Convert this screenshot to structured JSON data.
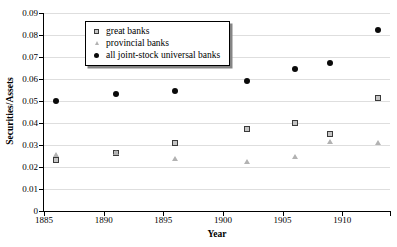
{
  "chart_data": {
    "type": "scatter",
    "title": "",
    "xlabel": "Year",
    "ylabel": "Securities/Assets",
    "xlim": [
      1885,
      1914
    ],
    "ylim": [
      0,
      0.09
    ],
    "grid": "horizontal",
    "legend_position": "top-left",
    "x_ticks": [
      1885,
      1890,
      1895,
      1900,
      1905,
      1910
    ],
    "x_tick_labels": [
      "1885",
      "1890",
      "1895",
      "1900",
      "1905",
      "1910"
    ],
    "y_ticks": [
      0,
      0.01,
      0.02,
      0.03,
      0.04,
      0.05,
      0.06,
      0.07,
      0.08,
      0.09
    ],
    "y_tick_labels": [
      "0",
      "0.01",
      "0.02",
      "0.03",
      "0.04",
      "0.05",
      "0.06",
      "0.07",
      "0.08",
      "0.09"
    ],
    "x": [
      1886,
      1891,
      1896,
      1902,
      1906,
      1909,
      1913
    ],
    "series": [
      {
        "name": "great banks",
        "marker": "square",
        "color": "#3a3a3a",
        "values": [
          0.023,
          0.0265,
          0.031,
          0.0375,
          0.04,
          0.035,
          0.0515
        ]
      },
      {
        "name": "provincial banks",
        "marker": "triangle",
        "color": "#b2b2b2",
        "values": [
          0.0255,
          0.0265,
          0.024,
          0.0225,
          0.025,
          0.0315,
          0.031
        ]
      },
      {
        "name": "all joint-stock universal banks",
        "marker": "circle",
        "color": "#0a0a0a",
        "values": [
          0.05,
          0.053,
          0.0545,
          0.059,
          0.0645,
          0.0675,
          0.0825
        ]
      }
    ]
  }
}
